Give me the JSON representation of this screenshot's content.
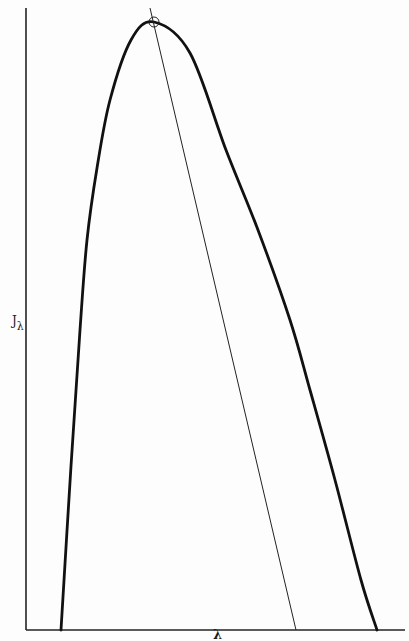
{
  "chart_data": {
    "type": "line",
    "title": "",
    "xlabel": "λ",
    "ylabel": "J",
    "ylabel_subscript": "λ",
    "grid": false,
    "legend": null,
    "x_ticks": [],
    "y_ticks": [],
    "series": [
      {
        "name": "J_lambda curve",
        "style": "thick",
        "points_px": [
          [
            61,
            630
          ],
          [
            71,
            466
          ],
          [
            80,
            330
          ],
          [
            87,
            240
          ],
          [
            97,
            168
          ],
          [
            110,
            100
          ],
          [
            131,
            40
          ],
          [
            154,
            22
          ],
          [
            190,
            53
          ],
          [
            226,
            150
          ],
          [
            258,
            230
          ],
          [
            290,
            320
          ],
          [
            310,
            390
          ],
          [
            335,
            480
          ],
          [
            361,
            580
          ],
          [
            377,
            630
          ]
        ]
      },
      {
        "name": "peak bisector line",
        "style": "thin",
        "points_px": [
          [
            150,
            8
          ],
          [
            296,
            630
          ]
        ]
      }
    ],
    "annotations": [
      {
        "type": "circle-marker",
        "label": "peak",
        "center_px": [
          154,
          22
        ],
        "radius_px": 5
      }
    ],
    "axes": {
      "y_axis_px": {
        "x": 26,
        "y_top": 8,
        "y_bottom": 630
      },
      "x_axis_px": {
        "y": 630,
        "x_left": 26,
        "x_right": 405
      }
    },
    "colors": {
      "line": "#111111",
      "background": "#fdfdfd"
    }
  }
}
